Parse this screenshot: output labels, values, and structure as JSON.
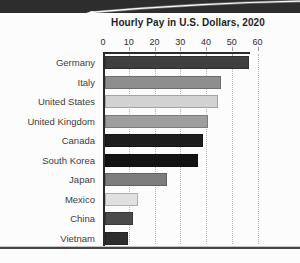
{
  "chart_data": {
    "type": "bar",
    "orientation": "horizontal",
    "title": "Hourly Pay in U.S. Dollars, 2020",
    "categories": [
      "Germany",
      "Italy",
      "United States",
      "United Kingdom",
      "Canada",
      "South Korea",
      "Japan",
      "Mexico",
      "China",
      "Vietnam"
    ],
    "values": [
      56,
      45,
      44,
      40,
      38,
      36,
      24,
      13,
      11,
      9
    ],
    "bar_colors": [
      "#3f3f3f",
      "#8e8e8e",
      "#d2d2d2",
      "#9e9e9e",
      "#1d1d1d",
      "#121212",
      "#7d7d7d",
      "#e0e0e0",
      "#4a4a4a",
      "#2d2d2d"
    ],
    "xlabel": "",
    "ylabel": "",
    "xlim": [
      0,
      60
    ],
    "x_ticks": [
      0,
      10,
      20,
      30,
      40,
      50,
      60
    ],
    "grid": "dotted-vertical",
    "legend": "none",
    "axis_color": "#2a2a2a",
    "gridline_color": "#b5b5b5",
    "label_color": "#3c3c3c"
  },
  "decor": {
    "top_band_color": "#2d2d2d",
    "glare_color": "#ffffff",
    "rule_light_color": "#c6c6c6",
    "rule_dark_color": "#464646",
    "page_color": "#fcfcfc"
  }
}
